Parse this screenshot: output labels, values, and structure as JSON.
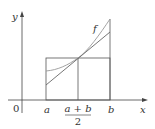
{
  "figure": {
    "axis_labels": {
      "x": "x",
      "y": "y"
    },
    "origin_label": "0",
    "tick_labels": {
      "a": "a",
      "midpoint_numerator": "a + b",
      "midpoint_denominator": "2",
      "b": "b"
    },
    "function_label": "f",
    "colors": {
      "axes": "#444444",
      "rectangle": "#555555",
      "curve": "#999999",
      "tangent": "#666666"
    }
  }
}
